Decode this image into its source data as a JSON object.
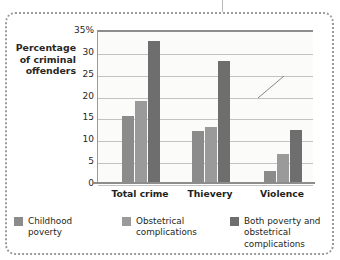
{
  "figure": {
    "frame_style": "dotted-rounded",
    "frame_color": "#9b9b9b"
  },
  "chart_data": {
    "type": "bar",
    "title": "",
    "xlabel": "",
    "ylabel": "Percentage of criminal offenders",
    "ylabel_lines": [
      "Percentage",
      "of criminal",
      "offenders"
    ],
    "categories": [
      "Total crime",
      "Thievery",
      "Violence"
    ],
    "series": [
      {
        "name": "Childhood poverty",
        "values": [
          15.3,
          11.8,
          2.8
        ],
        "color": "#8b8b8b"
      },
      {
        "name": "Obstetrical complications",
        "values": [
          18.7,
          12.8,
          6.7
        ],
        "color": "#9a9a9a"
      },
      {
        "name": "Both poverty and obstetrical complications",
        "values": [
          32.5,
          27.8,
          12.1
        ],
        "color": "#6e6e6e"
      }
    ],
    "ylim": [
      0,
      35
    ],
    "yticks": [
      0,
      5,
      10,
      15,
      20,
      25,
      30,
      35
    ],
    "ytick_labels": [
      "0",
      "5",
      "10",
      "15",
      "20",
      "25",
      "30",
      "35%"
    ],
    "grid": true,
    "legend_position": "bottom"
  },
  "legend": {
    "items": [
      {
        "label": "Childhood\npoverty",
        "color": "#8b8b8b"
      },
      {
        "label": "Obstetrical\ncomplications",
        "color": "#9a9a9a"
      },
      {
        "label": "Both poverty and\nobstetrical complications",
        "color": "#6e6e6e"
      }
    ]
  }
}
